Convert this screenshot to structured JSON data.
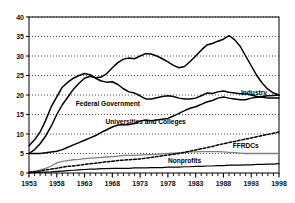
{
  "chart_data": {
    "type": "line",
    "title": "",
    "subtitle": "",
    "xlabel": "",
    "ylabel": "",
    "xlim": [
      1953,
      1998
    ],
    "ylim": [
      0,
      40
    ],
    "yticks": [
      0,
      5,
      10,
      15,
      20,
      25,
      30,
      35,
      40
    ],
    "xticks": [
      1953,
      1958,
      1963,
      1968,
      1973,
      1978,
      1983,
      1988,
      1993,
      1998
    ],
    "xtick_labels": [
      "1953",
      "1958",
      "1963",
      "1968",
      "1973",
      "1978",
      "1983",
      "1988",
      "1993",
      "1998"
    ],
    "ytick_labels": [
      "0",
      "5",
      "10",
      "15",
      "20",
      "25",
      "30",
      "35",
      "40"
    ],
    "grid": "horizontal-dotted",
    "grid_color": "#000000",
    "legend_position": "inline-annotations",
    "x": [
      1953,
      1954,
      1955,
      1956,
      1957,
      1958,
      1959,
      1960,
      1961,
      1962,
      1963,
      1964,
      1965,
      1966,
      1967,
      1968,
      1969,
      1970,
      1971,
      1972,
      1973,
      1974,
      1975,
      1976,
      1977,
      1978,
      1979,
      1980,
      1981,
      1982,
      1983,
      1984,
      1985,
      1986,
      1987,
      1988,
      1989,
      1990,
      1991,
      1992,
      1993,
      1994,
      1995,
      1996,
      1997,
      1998
    ],
    "series": [
      {
        "name": "Federal Government",
        "label": "Federal Government",
        "line_style": "solid",
        "color": "#000000",
        "label_x": 1967.2,
        "label_y": 17.3,
        "values": [
          7.0,
          8.5,
          10.5,
          13.5,
          17.0,
          19.5,
          22.0,
          23.3,
          24.3,
          25.0,
          25.5,
          25.2,
          24.3,
          23.6,
          23.3,
          23.4,
          22.7,
          21.6,
          20.8,
          20.5,
          19.8,
          19.0,
          19.0,
          19.3,
          19.6,
          19.8,
          19.6,
          19.2,
          19.0,
          19.0,
          19.2,
          19.8,
          20.5,
          20.4,
          20.8,
          21.0,
          20.7,
          20.5,
          20.3,
          20.3,
          20.0,
          19.6,
          19.4,
          19.2,
          19.2,
          19.2
        ],
        "values_note": "peak ~31 reached on the upper curve; see industry series"
      },
      {
        "name": "Industry",
        "label": "Industry",
        "line_style": "solid",
        "color": "#000000",
        "label_x": 1993.5,
        "label_y": 20.0,
        "values": [
          5.0,
          5.0,
          5.0,
          5.2,
          5.4,
          5.6,
          6.0,
          6.6,
          7.2,
          7.8,
          8.4,
          9.0,
          9.6,
          10.4,
          11.1,
          11.8,
          12.3,
          12.4,
          12.4,
          12.7,
          13.3,
          13.6,
          13.4,
          13.6,
          13.8,
          14.0,
          14.6,
          15.3,
          16.0,
          16.6,
          17.0,
          17.6,
          18.2,
          18.6,
          19.2,
          19.5,
          19.2,
          19.0,
          18.8,
          18.8,
          19.2,
          19.4,
          19.6,
          19.8,
          19.9,
          20.0
        ]
      },
      {
        "name": "Universities and Colleges",
        "label": "Universities and Colleges",
        "line_style": "solid-gray",
        "color": "#808080",
        "label_x": 1974.0,
        "label_y": 12.6,
        "values": [
          0.3,
          0.5,
          0.8,
          1.2,
          1.8,
          2.6,
          3.0,
          3.2,
          3.4,
          3.5,
          3.7,
          3.8,
          3.9,
          4.0,
          4.1,
          4.2,
          4.3,
          4.5,
          4.5,
          4.5,
          4.6,
          4.7,
          4.7,
          4.8,
          4.9,
          5.0,
          5.1,
          5.2,
          5.3,
          5.4,
          5.4,
          5.5,
          5.5,
          5.5,
          5.5,
          5.4,
          5.3,
          5.2,
          5.1,
          5.0,
          5.0,
          5.0,
          5.0,
          5.0,
          5.0,
          5.0
        ]
      },
      {
        "name": "FFRDCs",
        "label": "FFRDCs",
        "line_style": "dashed",
        "color": "#000000",
        "label_x": 1992.0,
        "label_y": 6.3,
        "values": [
          0.2,
          0.3,
          0.5,
          0.8,
          1.0,
          1.2,
          1.5,
          1.7,
          1.8,
          2.0,
          2.2,
          2.4,
          2.5,
          2.7,
          2.9,
          3.0,
          3.2,
          3.3,
          3.4,
          3.5,
          3.6,
          3.8,
          4.0,
          4.2,
          4.4,
          4.6,
          4.8,
          5.0,
          5.3,
          5.6,
          5.9,
          6.2,
          6.5,
          6.8,
          7.2,
          7.5,
          7.8,
          8.1,
          8.4,
          8.7,
          9.0,
          9.3,
          9.6,
          9.9,
          10.2,
          10.5
        ]
      },
      {
        "name": "Nonprofits",
        "label": "Nonprofits",
        "line_style": "solid-thin",
        "color": "#000000",
        "label_x": 1981.0,
        "label_y": 2.6,
        "values": [
          0.1,
          0.15,
          0.2,
          0.25,
          0.3,
          0.4,
          0.5,
          0.6,
          0.7,
          0.8,
          0.9,
          1.0,
          1.0,
          1.1,
          1.1,
          1.2,
          1.2,
          1.2,
          1.2,
          1.3,
          1.3,
          1.3,
          1.4,
          1.4,
          1.4,
          1.5,
          1.5,
          1.5,
          1.6,
          1.6,
          1.7,
          1.7,
          1.8,
          1.8,
          1.9,
          1.9,
          2.0,
          2.0,
          2.0,
          2.1,
          2.1,
          2.2,
          2.2,
          2.3,
          2.3,
          2.4
        ]
      },
      {
        "name": "Industry-upper-curve",
        "label": "",
        "line_style": "solid",
        "color": "#000000",
        "label_x": 0,
        "label_y": 0,
        "values": [
          5.0,
          6.0,
          7.5,
          9.5,
          12.0,
          15.0,
          17.5,
          19.5,
          21.5,
          23.0,
          24.3,
          24.8,
          24.4,
          24.6,
          25.5,
          27.0,
          28.3,
          29.2,
          29.5,
          29.3,
          30.0,
          30.6,
          30.5,
          30.0,
          29.3,
          28.5,
          27.6,
          27.0,
          27.3,
          28.6,
          30.0,
          31.5,
          32.8,
          33.2,
          33.8,
          34.3,
          35.2,
          34.2,
          32.5,
          30.0,
          27.5,
          25.0,
          23.0,
          21.5,
          20.5,
          20.0
        ],
        "values_note": "the tall bell-shaped curve labeled Industry"
      }
    ]
  },
  "annotations": {
    "federal_government": "Federal Government",
    "industry": "Industry",
    "universities_and_colleges": "Universities and Colleges",
    "ffrdcs": "FFRDCs",
    "nonprofits": "Nonprofits"
  },
  "axes": {
    "y_labels": [
      "40",
      "35",
      "30",
      "25",
      "20",
      "15",
      "10",
      "5",
      "0"
    ],
    "x_labels": [
      "1953",
      "1958",
      "1963",
      "1968",
      "1973",
      "1978",
      "1983",
      "1988",
      "1993",
      "1998"
    ]
  },
  "style": {
    "frame_color": "#000000",
    "gray_series_color": "#808080",
    "background": "#ffffff"
  }
}
